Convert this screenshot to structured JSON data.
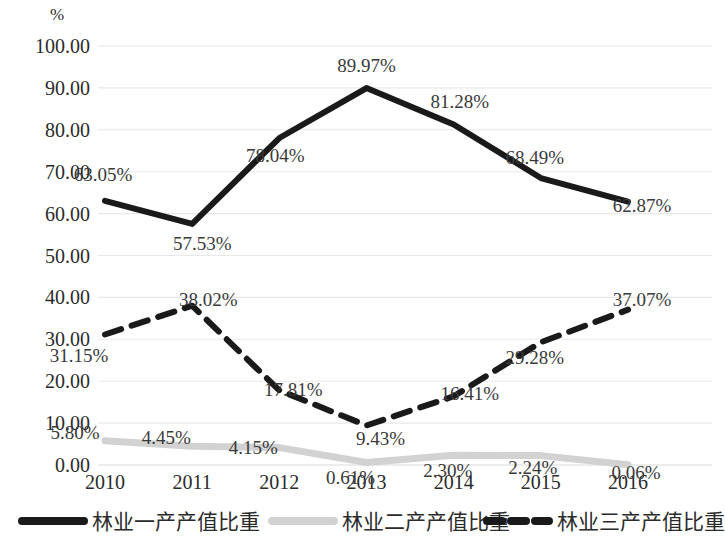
{
  "chart_data": {
    "type": "line",
    "title": "",
    "xlabel": "",
    "ylabel": "%",
    "unit_label": "%",
    "categories": [
      "2010",
      "2011",
      "2012",
      "2013",
      "2014",
      "2015",
      "2016"
    ],
    "ylim": [
      0,
      100
    ],
    "ytick_labels": [
      "100.00",
      "90.00",
      "80.00",
      "70.00",
      "60.00",
      "50.00",
      "40.00",
      "30.00",
      "20.00",
      "10.00",
      "0.00"
    ],
    "ytick_values": [
      100,
      90,
      80,
      70,
      60,
      50,
      40,
      30,
      20,
      10,
      0
    ],
    "grid": true,
    "legend_position": "bottom",
    "series": [
      {
        "name": "林业一产产值比重",
        "style": "solid",
        "color": "#1a1a1a",
        "values": [
          63.05,
          57.53,
          78.04,
          89.97,
          81.28,
          68.49,
          62.87
        ],
        "labels": [
          "63.05%",
          "57.53%",
          "78.04%",
          "89.97%",
          "81.28%",
          "68.49%",
          "62.87%"
        ]
      },
      {
        "name": "林业二产产值比重",
        "style": "solid",
        "color": "#d2d2d2",
        "values": [
          5.8,
          4.45,
          4.15,
          0.61,
          2.3,
          2.24,
          0.06
        ],
        "labels": [
          "5.80%",
          "4.45%",
          "4.15%",
          "0.61%",
          "2.30%",
          "2.24%",
          "0.06%"
        ]
      },
      {
        "name": "林业三产产值比重",
        "style": "dashed",
        "color": "#1a1a1a",
        "values": [
          31.15,
          38.02,
          17.81,
          9.43,
          16.41,
          29.28,
          37.07
        ],
        "labels": [
          "31.15%",
          "38.02%",
          "17.81%",
          "9.43%",
          "16.41%",
          "29.28%",
          "37.07%"
        ]
      }
    ],
    "point_label_offsets": [
      [
        [
          -2,
          -20
        ],
        [
          10,
          26
        ],
        [
          -4,
          24
        ],
        [
          0,
          -16
        ],
        [
          6,
          -16
        ],
        [
          -6,
          -14
        ],
        [
          14,
          10
        ]
      ],
      [
        [
          -30,
          -2
        ],
        [
          -26,
          -2
        ],
        [
          -26,
          6
        ],
        [
          -16,
          22
        ],
        [
          -6,
          22
        ],
        [
          -8,
          18
        ],
        [
          8,
          14
        ]
      ],
      [
        [
          -26,
          28
        ],
        [
          16,
          0
        ],
        [
          14,
          6
        ],
        [
          14,
          20
        ],
        [
          16,
          4
        ],
        [
          -6,
          22
        ],
        [
          14,
          -4
        ]
      ]
    ]
  },
  "legend": {
    "items": [
      {
        "label": "林业一产产值比重",
        "color": "#1a1a1a",
        "style": "solid"
      },
      {
        "label": "林业二产产值比重",
        "color": "#d2d2d2",
        "style": "solid"
      },
      {
        "label": "林业三产产值比重",
        "color": "#1a1a1a",
        "style": "dashed"
      }
    ]
  }
}
